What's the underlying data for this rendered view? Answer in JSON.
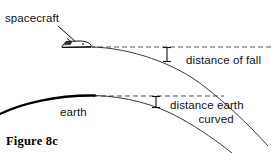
{
  "figure": {
    "caption": "Figure 8c",
    "background_color": "#ffffff",
    "ink_color": "#111111"
  },
  "labels": {
    "spacecraft": "spacecraft",
    "earth": "earth",
    "distance_of_fall": "distance of fall",
    "distance_earth_curved_line1": "distance earth",
    "distance_earth_curved_line2": "curved"
  },
  "graphics": {
    "spacecraft_icon": "spacecraft-shuttle-icon",
    "leader_line": "spacecraft-leader-line",
    "trajectory_curve": "spacecraft-trajectory-curve",
    "earth_surface_curve": "earth-surface-curve",
    "earth_tangent_extension": "earth-surface-thin-extension",
    "upper_dashed_line": "horizontal-dashed-reference-upper",
    "lower_dashed_line": "horizontal-dashed-reference-lower",
    "fall_dimension_marker": "distance-of-fall-dimension-marker",
    "curve_dimension_marker": "distance-earth-curved-dimension-marker"
  }
}
